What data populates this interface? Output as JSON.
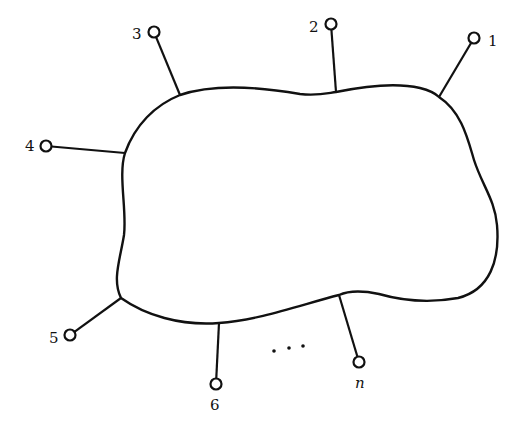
{
  "diagram": {
    "colors": {
      "stroke": "#111111",
      "background": "#ffffff"
    },
    "terminals": [
      {
        "label": "1",
        "node": [
          474,
          38
        ],
        "attach": [
          439,
          97
        ],
        "label_pos": [
          488,
          46
        ],
        "italic": false
      },
      {
        "label": "2",
        "node": [
          331,
          24
        ],
        "attach": [
          336,
          92
        ],
        "label_pos": [
          309,
          32
        ],
        "italic": false
      },
      {
        "label": "3",
        "node": [
          154,
          32
        ],
        "attach": [
          180,
          95
        ],
        "label_pos": [
          132,
          39
        ],
        "italic": false
      },
      {
        "label": "4",
        "node": [
          46,
          146
        ],
        "attach": [
          125,
          153
        ],
        "label_pos": [
          25,
          151
        ],
        "italic": false
      },
      {
        "label": "5",
        "node": [
          70,
          335
        ],
        "attach": [
          121,
          298
        ],
        "label_pos": [
          49,
          343
        ],
        "italic": false
      },
      {
        "label": "6",
        "node": [
          216,
          384
        ],
        "attach": [
          219,
          323
        ],
        "label_pos": [
          210,
          410
        ],
        "italic": false
      },
      {
        "label": "n",
        "node": [
          359,
          362
        ],
        "attach": [
          339,
          295
        ],
        "label_pos": [
          355,
          388
        ],
        "italic": true
      }
    ],
    "ellipsis": {
      "text": "...",
      "dots": [
        [
          274,
          351
        ],
        [
          289,
          348
        ],
        [
          303,
          346
        ]
      ]
    }
  }
}
